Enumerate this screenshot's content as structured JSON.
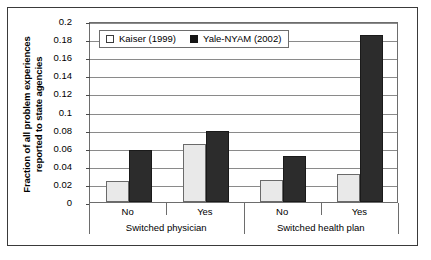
{
  "chart_data": {
    "type": "bar",
    "title": "",
    "xlabel": "",
    "ylabel": "Fraction of all problem experiences reported to state agencies",
    "ylabel_line1": "Fraction of all problem experiences",
    "ylabel_line2": "reported to state agencies",
    "ylim": [
      0,
      0.2
    ],
    "ytick_labels": [
      "0.2",
      "0.18",
      "0.16",
      "0.14",
      "0.12",
      "0.1",
      "0.08",
      "0.06",
      "0.04",
      "0.02",
      "0"
    ],
    "ytick_values": [
      0.2,
      0.18,
      0.16,
      0.14,
      0.12,
      0.1,
      0.08,
      0.06,
      0.04,
      0.02,
      0
    ],
    "grid": true,
    "legend_position": "top-left-inside",
    "groups": [
      {
        "name": "Switched physician",
        "categories": [
          "No",
          "Yes"
        ]
      },
      {
        "name": "Switched health plan",
        "categories": [
          "No",
          "Yes"
        ]
      }
    ],
    "categories": [
      "No",
      "Yes",
      "No",
      "Yes"
    ],
    "series": [
      {
        "name": "Kaiser (1999)",
        "color": "#e9e9e9",
        "values": [
          0.023,
          0.064,
          0.024,
          0.031
        ]
      },
      {
        "name": "Yale-NYAM (2002)",
        "color": "#2c2c2c",
        "values": [
          0.057,
          0.079,
          0.051,
          0.185
        ]
      }
    ]
  },
  "legend": {
    "entries": [
      {
        "label": "Kaiser (1999)",
        "swatch": "light"
      },
      {
        "label": "Yale-NYAM (2002)",
        "swatch": "dark"
      }
    ]
  }
}
